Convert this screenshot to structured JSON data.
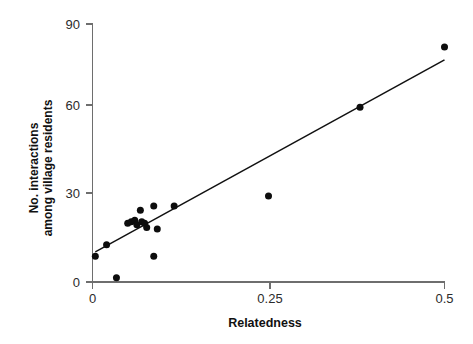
{
  "chart_data": {
    "type": "scatter",
    "title": "",
    "subtitle": "",
    "xlabel": "Relatedness",
    "ylabel_line1": "No. interactions",
    "ylabel_line2": "among village residents",
    "ylabel": "No. interactions among village residents",
    "xlim": [
      0,
      0.5
    ],
    "ylim": [
      0,
      90
    ],
    "xticks": [
      0,
      0.25,
      0.5
    ],
    "xtick_labels": [
      "0",
      "0.25",
      "0.5"
    ],
    "yticks": [
      0,
      30,
      60,
      90
    ],
    "ytick_labels": [
      "0",
      "30",
      "60",
      "90"
    ],
    "grid": false,
    "legend": false,
    "legend_position": "none",
    "marker": "filled-circle",
    "marker_color": "#0d0d0d",
    "marker_size_px": 7,
    "points": [
      {
        "x": 0.004,
        "y": 9
      },
      {
        "x": 0.02,
        "y": 13
      },
      {
        "x": 0.034,
        "y": 1.5
      },
      {
        "x": 0.05,
        "y": 20.5
      },
      {
        "x": 0.055,
        "y": 21
      },
      {
        "x": 0.06,
        "y": 21.5
      },
      {
        "x": 0.063,
        "y": 20
      },
      {
        "x": 0.068,
        "y": 25
      },
      {
        "x": 0.07,
        "y": 21
      },
      {
        "x": 0.074,
        "y": 20.5
      },
      {
        "x": 0.077,
        "y": 19
      },
      {
        "x": 0.087,
        "y": 26.5
      },
      {
        "x": 0.087,
        "y": 9
      },
      {
        "x": 0.092,
        "y": 18.5
      },
      {
        "x": 0.116,
        "y": 26.5
      },
      {
        "x": 0.25,
        "y": 30
      },
      {
        "x": 0.38,
        "y": 61
      },
      {
        "x": 0.5,
        "y": 82
      }
    ],
    "trendline": {
      "type": "linear-fit",
      "x_start": 0.004,
      "y_start": 10.5,
      "x_end": 0.5,
      "y_end": 77.5,
      "color": "#111111"
    }
  },
  "figure": {
    "background_color": "#ffffff",
    "axis_color": "#6e6e6e"
  }
}
